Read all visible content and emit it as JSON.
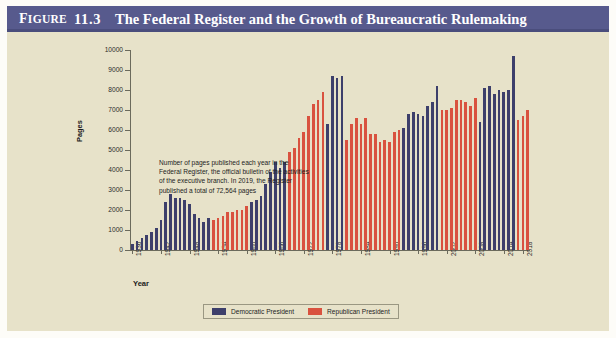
{
  "figure": {
    "label_figure": "Figure",
    "label_f": "F",
    "label_igure": "IGURE",
    "number": "11.3",
    "title": "The Federal Register and the Growth of Bureaucratic Rulemaking"
  },
  "colors": {
    "title_bar": "#575a8d",
    "panel_background": "#e7e2c9",
    "democratic": "#3d3f6b",
    "republican": "#d9523f",
    "axis": "#6b6a5c",
    "text": "#1d1d1d"
  },
  "annotation": {
    "text": "Number of pages published each year in the Federal Register, the official bulletin of the activities of the executive branch. In 2019, the Register published a total of 72,564 pages"
  },
  "legend": {
    "items": [
      {
        "label": "Democratic President",
        "color": "#3d3f6b"
      },
      {
        "label": "Republican President",
        "color": "#d9523f"
      }
    ]
  },
  "chart_data": {
    "type": "bar",
    "title": "The Federal Register and the Growth of Bureaucratic Rulemaking",
    "xlabel": "Year",
    "ylabel": "Pages",
    "ylim": [
      0,
      10000
    ],
    "ytick_step": 1000,
    "yticks": [
      0,
      1000,
      2000,
      3000,
      4000,
      5000,
      6000,
      7000,
      8000,
      9000,
      10000
    ],
    "xticks": [
      1936,
      1942,
      1948,
      1954,
      1960,
      1966,
      1972,
      1978,
      1984,
      1990,
      1996,
      2002,
      2008,
      2014,
      2018
    ],
    "grid": false,
    "legend_position": "bottom",
    "series_key": "party",
    "categories": [
      1936,
      1937,
      1938,
      1939,
      1940,
      1941,
      1942,
      1943,
      1944,
      1945,
      1946,
      1947,
      1948,
      1949,
      1950,
      1951,
      1952,
      1953,
      1954,
      1955,
      1956,
      1957,
      1958,
      1959,
      1960,
      1961,
      1962,
      1963,
      1964,
      1965,
      1966,
      1967,
      1968,
      1969,
      1970,
      1971,
      1972,
      1973,
      1974,
      1975,
      1976,
      1977,
      1978,
      1979,
      1980,
      1981,
      1982,
      1983,
      1984,
      1985,
      1986,
      1987,
      1988,
      1989,
      1990,
      1991,
      1992,
      1993,
      1994,
      1995,
      1996,
      1997,
      1998,
      1999,
      2000,
      2001,
      2002,
      2003,
      2004,
      2005,
      2006,
      2007,
      2008,
      2009,
      2010,
      2011,
      2012,
      2013,
      2014,
      2015,
      2016,
      2017,
      2018,
      2019
    ],
    "values": [
      280,
      450,
      600,
      750,
      900,
      1100,
      1500,
      2400,
      2800,
      2600,
      2600,
      2500,
      2300,
      1800,
      1600,
      1400,
      1600,
      1500,
      1600,
      1700,
      1900,
      1900,
      2000,
      2000,
      2200,
      2400,
      2500,
      2700,
      3300,
      3900,
      4400,
      4100,
      4400,
      4900,
      5100,
      5600,
      5900,
      6700,
      7300,
      7500,
      7900,
      6300,
      8700,
      8600,
      8700,
      5500,
      6300,
      6600,
      6300,
      6600,
      5800,
      5800,
      5400,
      5500,
      5400,
      5900,
      6000,
      6100,
      6800,
      6900,
      6800,
      6700,
      7200,
      7400,
      8200,
      7000,
      7000,
      7100,
      7500,
      7500,
      7400,
      7200,
      7600,
      6400,
      8100,
      8200,
      7800,
      8000,
      7900,
      8000,
      9700,
      6500,
      6700,
      7000
    ],
    "parties": [
      "D",
      "D",
      "D",
      "D",
      "D",
      "D",
      "D",
      "D",
      "D",
      "D",
      "D",
      "D",
      "D",
      "D",
      "D",
      "D",
      "D",
      "R",
      "R",
      "R",
      "R",
      "R",
      "R",
      "R",
      "R",
      "D",
      "D",
      "D",
      "D",
      "D",
      "D",
      "D",
      "D",
      "R",
      "R",
      "R",
      "R",
      "R",
      "R",
      "R",
      "R",
      "D",
      "D",
      "D",
      "D",
      "R",
      "R",
      "R",
      "R",
      "R",
      "R",
      "R",
      "R",
      "R",
      "R",
      "R",
      "R",
      "D",
      "D",
      "D",
      "D",
      "D",
      "D",
      "D",
      "D",
      "R",
      "R",
      "R",
      "R",
      "R",
      "R",
      "R",
      "R",
      "D",
      "D",
      "D",
      "D",
      "D",
      "D",
      "D",
      "D",
      "R",
      "R",
      "R"
    ]
  }
}
